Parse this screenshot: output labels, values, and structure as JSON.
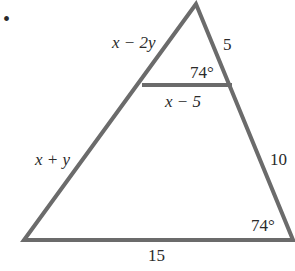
{
  "diagram": {
    "type": "similar-triangles",
    "marker": "•",
    "colors": {
      "stroke": "#6b6b6b",
      "text": "#2a2a2a",
      "background": "#ffffff"
    },
    "vertices": {
      "apex": [
        196,
        4
      ],
      "bottom_left": [
        24,
        240
      ],
      "bottom_right": [
        293,
        240
      ],
      "inner_left": [
        142,
        85
      ],
      "inner_right": [
        232,
        85
      ]
    },
    "labels": {
      "upper_left_side": "x − 2y",
      "upper_right_side": "5",
      "inner_angle": "74°",
      "inner_segment": "x − 5",
      "lower_left_side": "x + y",
      "lower_right_side": "10",
      "bottom_angle": "74°",
      "base": "15"
    }
  }
}
